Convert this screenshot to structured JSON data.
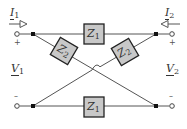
{
  "diagram": {
    "type": "lattice two-port network",
    "colors": {
      "wire": "#444444",
      "box_fill": "#c8c8c8",
      "box_stroke": "#222222",
      "text": "#333333"
    },
    "port1": {
      "current_label": "I",
      "current_sub": "1",
      "voltage_label": "V",
      "voltage_sub": "1",
      "plus": "+",
      "minus": "–"
    },
    "port2": {
      "current_label": "I",
      "current_sub": "2",
      "voltage_label": "V",
      "voltage_sub": "2",
      "plus": "+",
      "minus": "–"
    },
    "impedances": {
      "top": {
        "label": "Z",
        "sub": "1"
      },
      "bottom": {
        "label": "Z",
        "sub": "1"
      },
      "diag_left": {
        "label": "Z",
        "sub": "2"
      },
      "diag_right": {
        "label": "Z",
        "sub": "2"
      }
    }
  }
}
